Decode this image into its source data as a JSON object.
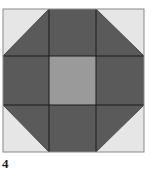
{
  "figure": {
    "label": "4",
    "block": {
      "name": "shoo-fly quilt block",
      "grid": "3x3",
      "colors": {
        "dark": "#5a5a5a",
        "center": "#9a9a9a",
        "light": "#e6e6e6",
        "line": "#1a1a1a"
      }
    }
  }
}
